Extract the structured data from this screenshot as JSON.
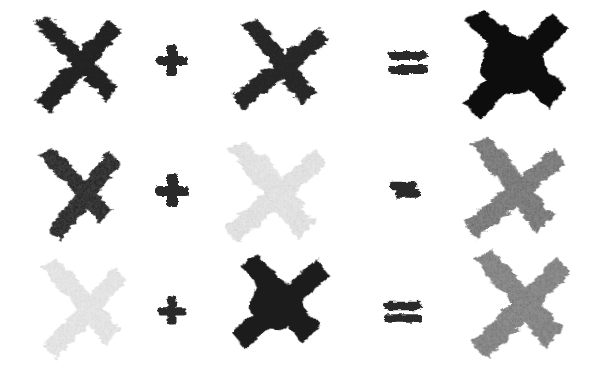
{
  "artwork": {
    "title": "Painted X Equations",
    "description": "Three hand-painted equations of brush-stroke X marks on white",
    "background_color": "#ffffff",
    "width": 593,
    "height": 366,
    "rows_count": 3
  },
  "palette": {
    "very_dark": "#1d1d1d",
    "dark": "#262626",
    "darkest": "#0c0c0c",
    "mid_gray": "#8a8a8a",
    "mid_gray_dark": "#6e6e6e",
    "light_gray": "#e2e2e2",
    "very_light_gray": "#e8e8e8",
    "operator_color": "#2a2a2a",
    "white": "#ffffff"
  },
  "rows": [
    {
      "id": "row-1",
      "top": 6,
      "height": 116,
      "operand_a": {
        "name": "x-mark-dark-a1",
        "label": "dark X",
        "color": "#232323",
        "opacity": 1,
        "size": 112,
        "rotate": -4,
        "texture": "brush-rough",
        "left": 18,
        "top": 8
      },
      "operator_plus": {
        "name": "plus-operator",
        "label": "+",
        "symbol": "plus",
        "color": "#2a2a2a",
        "size": 40,
        "left": 152,
        "top": 40
      },
      "operand_b": {
        "name": "x-mark-dark-b1",
        "label": "dark X",
        "color": "#262626",
        "opacity": 1,
        "size": 108,
        "rotate": 6,
        "texture": "brush-rough",
        "left": 222,
        "top": 12
      },
      "operator_equals": {
        "name": "equals-operator",
        "label": "=",
        "symbol": "equals",
        "color": "#2c2c2c",
        "size": 44,
        "left": 386,
        "top": 44,
        "style": "two-bars"
      },
      "result": {
        "name": "x-mark-result-darkest",
        "label": "darkest X",
        "color": "#0b0b0b",
        "opacity": 1,
        "size": 122,
        "rotate": -2,
        "texture": "brush-solid",
        "left": 452,
        "top": 4
      }
    },
    {
      "id": "row-2",
      "top": 128,
      "height": 116,
      "operand_a": {
        "name": "x-mark-dark-a2",
        "label": "dark X",
        "color": "#262626",
        "opacity": 1,
        "size": 100,
        "rotate": -8,
        "texture": "brush-canvas",
        "left": 26,
        "top": 142
      },
      "operator_plus": {
        "name": "plus-operator",
        "label": "+",
        "symbol": "plus",
        "color": "#2a2a2a",
        "size": 40,
        "left": 152,
        "top": 170
      },
      "operand_b": {
        "name": "x-mark-light-b2",
        "label": "light gray X",
        "color": "#e3e3e3",
        "opacity": 1,
        "size": 114,
        "rotate": 2,
        "texture": "brush-canvas",
        "left": 214,
        "top": 138
      },
      "operator_equals": {
        "name": "equals-operator",
        "label": "=",
        "symbol": "equals",
        "color": "#2c2c2c",
        "size": 34,
        "left": 388,
        "top": 178,
        "style": "merged-bars"
      },
      "result": {
        "name": "x-mark-result-midgray-2",
        "label": "mid gray X",
        "color": "#767676",
        "opacity": 1,
        "size": 114,
        "rotate": 3,
        "texture": "brush-canvas",
        "left": 452,
        "top": 134
      }
    },
    {
      "id": "row-3",
      "top": 248,
      "height": 114,
      "operand_a": {
        "name": "x-mark-light-a3",
        "label": "light gray X",
        "color": "#e6e6e6",
        "opacity": 1,
        "size": 106,
        "rotate": -3,
        "texture": "brush-canvas",
        "left": 26,
        "top": 256
      },
      "operator_plus": {
        "name": "plus-operator",
        "label": "+",
        "symbol": "plus",
        "color": "#2a2a2a",
        "size": 36,
        "left": 154,
        "top": 292
      },
      "operand_b": {
        "name": "x-mark-dark-b3",
        "label": "dark X",
        "color": "#1f1f1f",
        "opacity": 1,
        "size": 110,
        "rotate": 4,
        "texture": "brush-solid",
        "left": 222,
        "top": 250
      },
      "operator_equals": {
        "name": "equals-operator",
        "label": "=",
        "symbol": "equals",
        "color": "#2c2c2c",
        "size": 42,
        "left": 382,
        "top": 296,
        "style": "two-bars"
      },
      "result": {
        "name": "x-mark-result-midgray-3",
        "label": "mid gray X",
        "color": "#808080",
        "opacity": 1,
        "size": 118,
        "rotate": -1,
        "texture": "brush-canvas",
        "left": 456,
        "top": 248
      }
    }
  ]
}
